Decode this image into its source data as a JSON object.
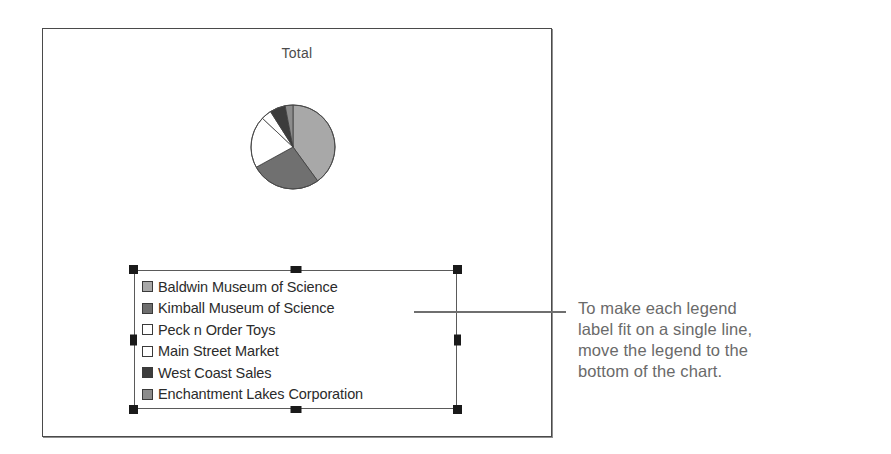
{
  "chart": {
    "title": "Total",
    "frame_border_color": "#4a4a4a"
  },
  "chart_data": {
    "type": "pie",
    "title": "Total",
    "categories": [
      "Baldwin Museum of Science",
      "Kimball Museum of Science",
      "Peck n Order Toys",
      "Main Street Market",
      "West Coast Sales",
      "Enchantment Lakes Corporation"
    ],
    "values": [
      40,
      27,
      20,
      4,
      6,
      3
    ],
    "colors": [
      "#a8a8a8",
      "#707070",
      "#ffffff",
      "#ffffff",
      "#3c3c3c",
      "#8c8c8c"
    ],
    "legend_position": "right",
    "start_angle": 0,
    "direction": "clockwise",
    "grid": false,
    "xlabel": "",
    "ylabel": ""
  },
  "legend": {
    "selected": true,
    "items": [
      {
        "label": "Baldwin Museum of Science",
        "swatch": "#a8a8a8"
      },
      {
        "label": "Kimball Museum of Science",
        "swatch": "#6e6e6e"
      },
      {
        "label": "Peck n Order Toys",
        "swatch": "#ffffff"
      },
      {
        "label": "Main Street Market",
        "swatch": "#ffffff"
      },
      {
        "label": "West Coast Sales",
        "swatch": "#3c3c3c"
      },
      {
        "label": "Enchantment Lakes Corporation",
        "swatch": "#8c8c8c"
      }
    ]
  },
  "callout": {
    "line1": "To make each legend",
    "line2": "label fit on a single line,",
    "line3": "move the legend to the",
    "line4": "bottom of the chart.",
    "text_color": "#6a6a6a"
  }
}
